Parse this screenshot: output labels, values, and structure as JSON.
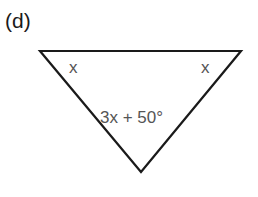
{
  "figure": {
    "part_label": "(d)",
    "shape": "triangle",
    "vertices": {
      "top_left": [
        40,
        51
      ],
      "top_right": [
        241,
        51
      ],
      "bottom": [
        141,
        172
      ]
    },
    "angles": {
      "top_left": "x",
      "top_right": "x",
      "bottom": "3x + 50°"
    },
    "colors": {
      "stroke": "#1a1a1a",
      "label_text": "#555555"
    }
  }
}
